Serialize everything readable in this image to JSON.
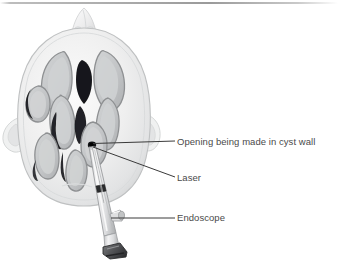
{
  "figure": {
    "kind": "medical-illustration",
    "view": "axial-head-with-ventricles",
    "background_color": "#ffffff",
    "line_color": "#3a3a3a",
    "text_color": "#4a4a4a",
    "top_rule_color": "#a8a8a8"
  },
  "annotations": [
    {
      "id": "opening",
      "label": "Opening being made in cyst wall",
      "leader": {
        "from_x": 92,
        "from_y": 145,
        "to_x": 175,
        "to_y": 141
      }
    },
    {
      "id": "laser",
      "label": "Laser",
      "leader": {
        "from_x": 92,
        "from_y": 146,
        "to_x": 175,
        "to_y": 177
      }
    },
    {
      "id": "endoscope",
      "label": "Endoscope",
      "leader": {
        "from_x": 111,
        "from_y": 218,
        "to_x": 175,
        "to_y": 218
      }
    }
  ],
  "anatomy": {
    "skull_outline": "ovoid cranium, axial slice",
    "nose": "anterior midline protrusion at top",
    "ears": "lateral auricles left and right",
    "ventricles": "lateral ventricles, third ventricle, enlarged cyst cavity",
    "skull_fill": "#eceded",
    "ventricle_fill": "#c5c7c8",
    "cavity_fill": "#17181a"
  },
  "instrument": {
    "name": "endoscope",
    "shaft_fill": "#e4e5e6",
    "collar_fill": "#2a2b2d",
    "base_fill": "#4c4d50",
    "laser_fiber": "thin fiber from endoscope tip to cyst wall opening"
  }
}
